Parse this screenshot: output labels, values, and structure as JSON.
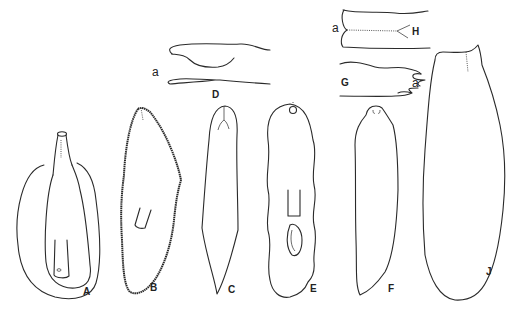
{
  "figure": {
    "panels": {
      "A": {
        "label": "A"
      },
      "B": {
        "label": "B"
      },
      "C": {
        "label": "C"
      },
      "D": {
        "label": "D",
        "part_label": "a"
      },
      "E": {
        "label": "E"
      },
      "F": {
        "label": "F"
      },
      "G": {
        "label": "G",
        "part_label": "a"
      },
      "H": {
        "label": "H",
        "part_label": "a"
      },
      "J": {
        "label": "J"
      }
    },
    "line_color": "#2a2a2a",
    "background": "#ffffff"
  }
}
